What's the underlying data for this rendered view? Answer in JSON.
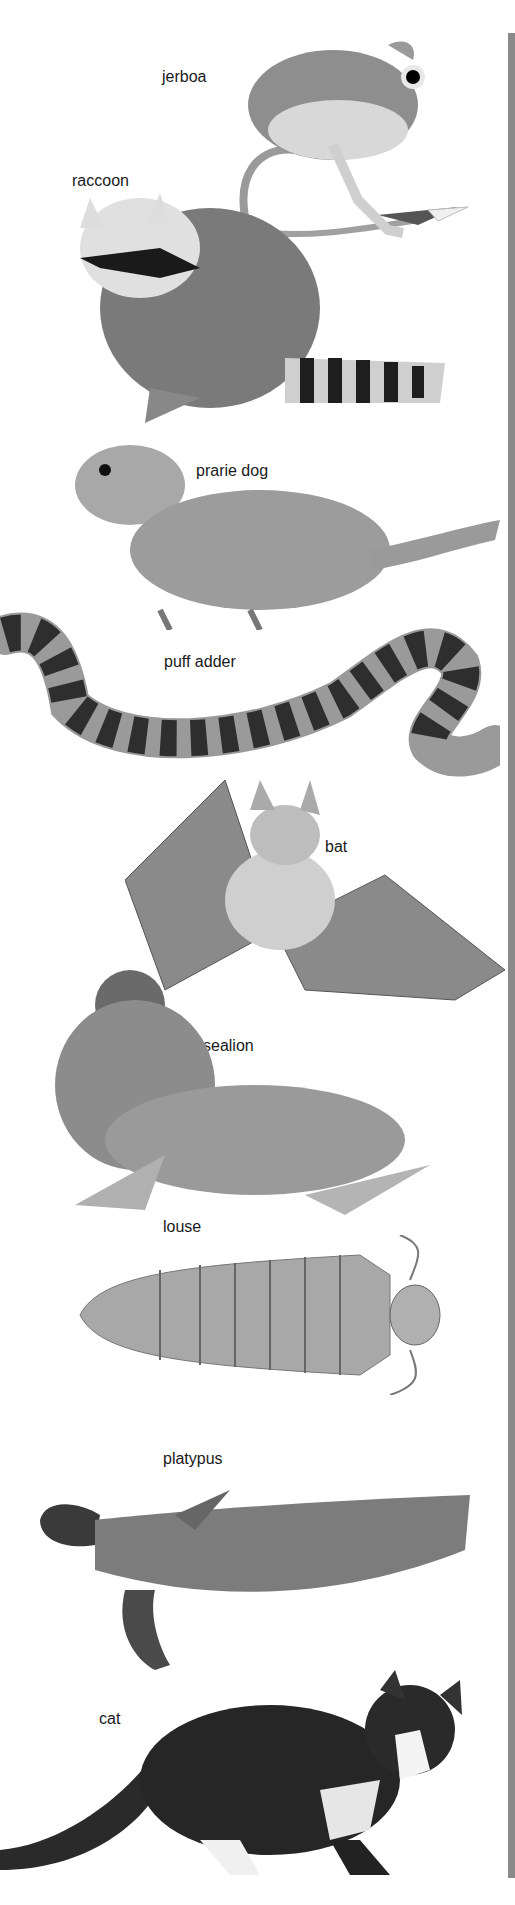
{
  "figure": {
    "frame_bar_color": "#8a8a8a",
    "animals": [
      {
        "id": "jerboa",
        "label": "jerboa"
      },
      {
        "id": "raccoon",
        "label": "raccoon"
      },
      {
        "id": "prairie-dog",
        "label": "prarie dog"
      },
      {
        "id": "puff-adder",
        "label": "puff adder"
      },
      {
        "id": "bat",
        "label": "bat"
      },
      {
        "id": "sealion",
        "label": "sealion"
      },
      {
        "id": "louse",
        "label": "louse"
      },
      {
        "id": "platypus",
        "label": "platypus"
      },
      {
        "id": "cat",
        "label": "cat"
      }
    ]
  }
}
